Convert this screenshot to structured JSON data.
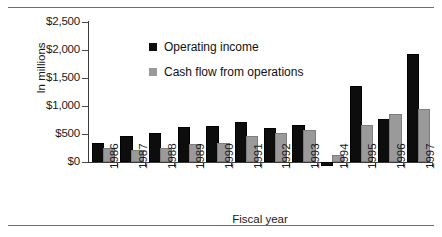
{
  "chart_data": {
    "type": "bar",
    "title": "",
    "xlabel": "Fiscal year",
    "ylabel": "In millions",
    "categories": [
      "1986",
      "1987",
      "1988",
      "1989",
      "1990",
      "1991",
      "1992",
      "1993",
      "1994",
      "1995",
      "1996",
      "1997"
    ],
    "series": [
      {
        "name": "Operating income",
        "color": "#0d0d0d",
        "values": [
          310,
          420,
          480,
          585,
          600,
          675,
          570,
          625,
          -25,
          1325,
          740,
          1890
        ]
      },
      {
        "name": "Cash flow from operations",
        "color": "#9a9a9a",
        "values": [
          215,
          185,
          215,
          285,
          300,
          420,
          480,
          540,
          95,
          630,
          820,
          910
        ]
      }
    ],
    "ylim": [
      0,
      2500
    ],
    "yticks": [
      0,
      500,
      1000,
      1500,
      2000,
      2500
    ],
    "ytick_labels": [
      "$0",
      "$500",
      "$1,000",
      "$1,500",
      "$2,000",
      "$2,500"
    ],
    "grid": false,
    "legend_position": "inside-top-left"
  },
  "legend": {
    "entries": [
      {
        "label": "Operating income"
      },
      {
        "label": "Cash flow from operations"
      }
    ]
  }
}
